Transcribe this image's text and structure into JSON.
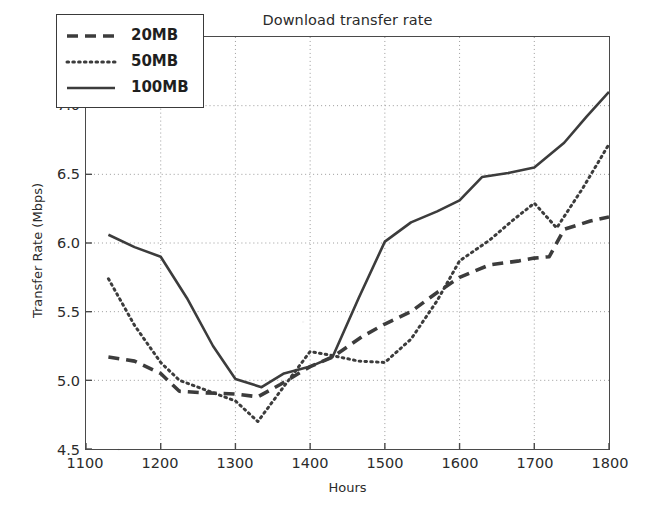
{
  "chart_data": {
    "type": "line",
    "title": "Download transfer rate",
    "xlabel": "Hours",
    "ylabel": "Transfer Rate (Mbps)",
    "xlim": [
      1100,
      1800
    ],
    "ylim": [
      4.5,
      7.5
    ],
    "xticks": [
      1100,
      1200,
      1300,
      1400,
      1500,
      1600,
      1700,
      1800
    ],
    "xtick_labels": [
      "1100",
      "1200",
      "1300",
      "1400",
      "1500",
      "1600",
      "1700",
      "1800"
    ],
    "yticks": [
      4.5,
      5.0,
      5.5,
      6.0,
      6.5,
      7.0,
      7.5
    ],
    "ytick_labels": [
      "4.5",
      "5.0",
      "5.5",
      "6.0",
      "6.5",
      "7.0",
      "7.5"
    ],
    "grid": true,
    "grid_style": "dotted",
    "legend_position": "upper left",
    "line_color": "#3c3c3c",
    "series": [
      {
        "name": "20MB",
        "style": "dashed",
        "x": [
          1130,
          1165,
          1200,
          1225,
          1255,
          1300,
          1330,
          1360,
          1400,
          1430,
          1470,
          1500,
          1535,
          1570,
          1600,
          1640,
          1680,
          1700,
          1720,
          1740,
          1775,
          1800
        ],
        "values": [
          5.17,
          5.14,
          5.05,
          4.92,
          4.91,
          4.9,
          4.88,
          4.97,
          5.1,
          5.17,
          5.32,
          5.41,
          5.5,
          5.64,
          5.75,
          5.84,
          5.87,
          5.89,
          5.9,
          6.1,
          6.16,
          6.19
        ]
      },
      {
        "name": "50MB",
        "style": "dotted",
        "x": [
          1130,
          1165,
          1200,
          1225,
          1260,
          1300,
          1330,
          1360,
          1400,
          1430,
          1465,
          1500,
          1535,
          1570,
          1600,
          1640,
          1670,
          1700,
          1730,
          1765,
          1800
        ],
        "values": [
          5.74,
          5.4,
          5.13,
          5.0,
          4.93,
          4.85,
          4.7,
          4.92,
          5.21,
          5.18,
          5.14,
          5.13,
          5.3,
          5.58,
          5.87,
          6.02,
          6.16,
          6.29,
          6.11,
          6.4,
          6.72
        ]
      },
      {
        "name": "100MB",
        "style": "solid",
        "x": [
          1130,
          1165,
          1200,
          1235,
          1270,
          1300,
          1335,
          1365,
          1400,
          1430,
          1465,
          1500,
          1535,
          1570,
          1600,
          1630,
          1665,
          1700,
          1740,
          1770,
          1800
        ],
        "values": [
          6.06,
          5.97,
          5.9,
          5.6,
          5.25,
          5.01,
          4.95,
          5.05,
          5.1,
          5.17,
          5.6,
          6.01,
          6.15,
          6.23,
          6.31,
          6.48,
          6.51,
          6.55,
          6.73,
          6.92,
          7.1
        ]
      }
    ],
    "legend_entries": [
      {
        "label": "20MB",
        "style": "dashed"
      },
      {
        "label": "50MB",
        "style": "dotted"
      },
      {
        "label": "100MB",
        "style": "solid"
      }
    ]
  }
}
